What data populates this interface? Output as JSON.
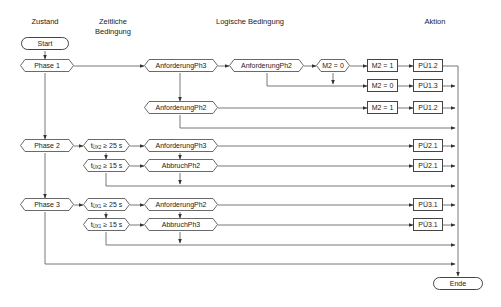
{
  "headers": {
    "zustand": "Zustand",
    "zeitliche_line1": "Zeitliche",
    "zeitliche_line2": "Bedingung",
    "logische": "Logische Bedingung",
    "aktion": "Aktion"
  },
  "terminals": {
    "start": "Start",
    "end": "Ende"
  },
  "states": {
    "phase1": "Phase 1",
    "phase2": "Phase 2",
    "phase3": "Phase 3"
  },
  "time_conditions": {
    "p2_t25": {
      "var": "t",
      "sub": "ÜX2",
      "cond": "≥ 25 s"
    },
    "p2_t15": {
      "var": "t",
      "sub": "ÜX2",
      "cond": "≥ 15 s"
    },
    "p3_t25": {
      "var": "t",
      "sub": "ÜX1",
      "cond": "≥ 25 s"
    },
    "p3_t15": {
      "var": "t",
      "sub": "ÜX1",
      "cond": "≥ 15 s"
    }
  },
  "logic_conditions": {
    "p1_anf_ph3": "AnforderungPh3",
    "p1_anf_ph2_a": "AnforderungPh2",
    "p1_m2_eq0": "M2 = 0",
    "p1_anf_ph2_b": "AnforderungPh2",
    "p2_anf_ph3": "AnforderungPh3",
    "p2_abbr_ph2": "AbbruchPh2",
    "p3_anf_ph2": "AnforderungPh2",
    "p3_abbr_ph3": "AbbruchPh3"
  },
  "actions": {
    "set_m2_1_a": "M2 = 1",
    "set_m2_0": "M2 = 0",
    "set_m2_1_b": "M2 = 1",
    "pu12_a": "PÜ1.2",
    "pu13": "PÜ1.3",
    "pu12_b": "PÜ1.2",
    "pu21_a": "PÜ2.1",
    "pu21_b": "PÜ2.1",
    "pu31_a": "PÜ3.1",
    "pu31_b": "PÜ3.1"
  },
  "colors": {
    "line": "#444444",
    "background": "#ffffff"
  }
}
